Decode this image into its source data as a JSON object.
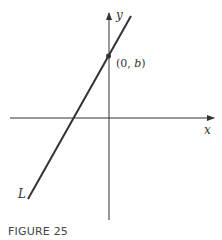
{
  "figure": {
    "caption": "FIGURE 25",
    "axes": {
      "x_label": "x",
      "y_label": "y"
    },
    "line_label": "L",
    "point": {
      "label_pre": "(0, ",
      "label_var": "b",
      "label_post": ")"
    },
    "colors": {
      "ink": "#333333",
      "background": "#ffffff"
    }
  }
}
